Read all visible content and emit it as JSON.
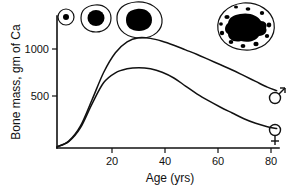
{
  "chart_data": {
    "type": "line",
    "title": "",
    "xlabel": "Age (yrs)",
    "ylabel": "Bone mass, gm of Ca",
    "xlim": [
      0,
      95
    ],
    "ylim": [
      0,
      1150
    ],
    "xticks": [
      20,
      40,
      60,
      80
    ],
    "yticks": [
      500,
      1000
    ],
    "grid": false,
    "legend_position": "right-inline",
    "series": [
      {
        "name": "male",
        "symbol": "♂",
        "x": [
          0,
          5,
          10,
          15,
          20,
          25,
          30,
          35,
          40,
          45,
          50,
          55,
          60,
          65,
          70,
          75,
          80,
          85,
          90,
          94
        ],
        "values": [
          10,
          60,
          190,
          420,
          660,
          830,
          925,
          960,
          955,
          930,
          895,
          855,
          815,
          770,
          725,
          680,
          630,
          580,
          530,
          500
        ]
      },
      {
        "name": "female",
        "symbol": "♀",
        "x": [
          0,
          5,
          10,
          15,
          20,
          25,
          30,
          35,
          40,
          45,
          50,
          55,
          60,
          65,
          70,
          75,
          80,
          85,
          90,
          94
        ],
        "values": [
          10,
          55,
          175,
          385,
          570,
          655,
          690,
          700,
          690,
          660,
          610,
          540,
          470,
          410,
          355,
          305,
          255,
          215,
          185,
          170
        ]
      }
    ],
    "annotations": [
      {
        "name": "bone-cross-section-infant",
        "label": "",
        "age_position": 2,
        "description": "very small bone cross-section with tiny solid core"
      },
      {
        "name": "bone-cross-section-child",
        "label": "",
        "age_position": 13,
        "description": "small bone cross-section with solid core"
      },
      {
        "name": "bone-cross-section-adult",
        "label": "",
        "age_position": 30,
        "description": "medium bone cross-section with large solid core"
      },
      {
        "name": "bone-cross-section-elderly",
        "label": "",
        "age_position": 80,
        "description": "large porous osteoporotic bone cross-section with many voids"
      }
    ]
  },
  "axes": {
    "y_title": "Bone mass, gm of Ca",
    "x_title": "Age (yrs)",
    "y_tick_labels": [
      "1000",
      "500"
    ],
    "x_tick_labels": [
      "20",
      "40",
      "60",
      "80"
    ]
  },
  "legend": {
    "male_symbol": "♂",
    "female_symbol": "♀"
  },
  "colors": {
    "ink": "#111111",
    "fill": "#000000",
    "background": "#ffffff"
  }
}
